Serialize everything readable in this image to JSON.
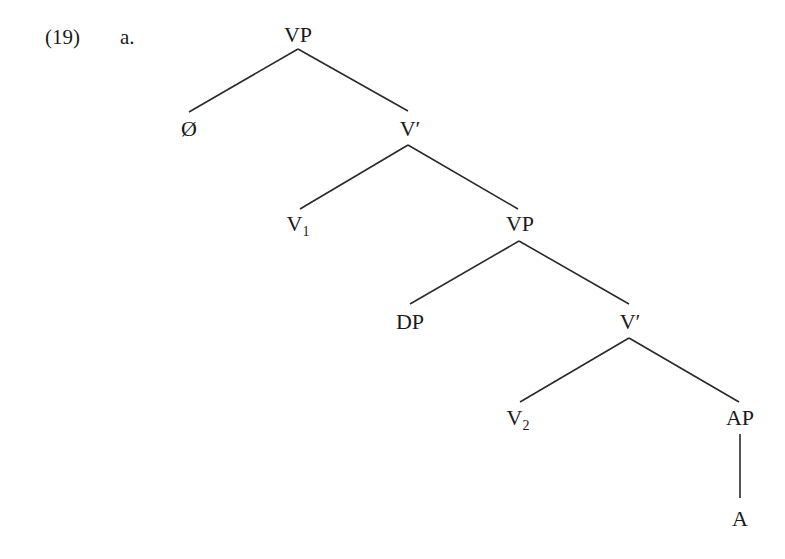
{
  "example": {
    "number": "(19)",
    "letter": "a."
  },
  "tree": {
    "nodes": [
      {
        "id": "vp1",
        "label": "VP",
        "sub": "",
        "x": 298,
        "y": 24
      },
      {
        "id": "null",
        "label": "Ø",
        "sub": "",
        "x": 189,
        "y": 118
      },
      {
        "id": "vbar1",
        "label": "V′",
        "sub": "",
        "x": 410,
        "y": 118
      },
      {
        "id": "v1",
        "label": "V",
        "sub": "1",
        "x": 298,
        "y": 213
      },
      {
        "id": "vp2",
        "label": "VP",
        "sub": "",
        "x": 520,
        "y": 213
      },
      {
        "id": "dp",
        "label": "DP",
        "sub": "",
        "x": 410,
        "y": 311
      },
      {
        "id": "vbar2",
        "label": "V′",
        "sub": "",
        "x": 630,
        "y": 311
      },
      {
        "id": "v2",
        "label": "V",
        "sub": "2",
        "x": 518,
        "y": 407
      },
      {
        "id": "ap",
        "label": "AP",
        "sub": "",
        "x": 740,
        "y": 407
      },
      {
        "id": "a",
        "label": "A",
        "sub": "",
        "x": 740,
        "y": 508
      }
    ],
    "edges": [
      {
        "from": "vp1",
        "to": "null",
        "x1": 298,
        "y1": 49,
        "x2": 189,
        "y2": 112
      },
      {
        "from": "vp1",
        "to": "vbar1",
        "x1": 298,
        "y1": 49,
        "x2": 408,
        "y2": 111
      },
      {
        "from": "vbar1",
        "to": "v1",
        "x1": 408,
        "y1": 145,
        "x2": 300,
        "y2": 209
      },
      {
        "from": "vbar1",
        "to": "vp2",
        "x1": 408,
        "y1": 145,
        "x2": 518,
        "y2": 209
      },
      {
        "from": "vp2",
        "to": "dp",
        "x1": 519,
        "y1": 241,
        "x2": 410,
        "y2": 304
      },
      {
        "from": "vp2",
        "to": "vbar2",
        "x1": 519,
        "y1": 241,
        "x2": 629,
        "y2": 304
      },
      {
        "from": "vbar2",
        "to": "v2",
        "x1": 629,
        "y1": 338,
        "x2": 520,
        "y2": 402
      },
      {
        "from": "vbar2",
        "to": "ap",
        "x1": 629,
        "y1": 338,
        "x2": 739,
        "y2": 402
      },
      {
        "from": "ap",
        "to": "a",
        "x1": 740,
        "y1": 434,
        "x2": 740,
        "y2": 498
      }
    ]
  }
}
